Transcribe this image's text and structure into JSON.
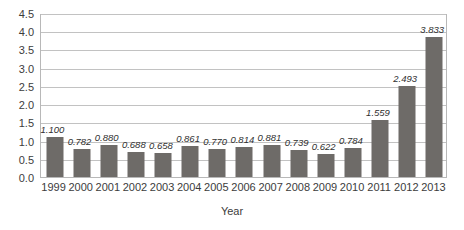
{
  "chart_data": {
    "type": "bar",
    "title": "",
    "xlabel": "Year",
    "ylabel": "",
    "categories": [
      "1999",
      "2000",
      "2001",
      "2002",
      "2003",
      "2004",
      "2005",
      "2006",
      "2007",
      "2008",
      "2009",
      "2010",
      "2011",
      "2012",
      "2013"
    ],
    "values": [
      1.1,
      0.782,
      0.88,
      0.688,
      0.658,
      0.861,
      0.77,
      0.814,
      0.881,
      0.739,
      0.622,
      0.784,
      1.559,
      2.493,
      3.833
    ],
    "data_labels": [
      "1.100",
      "0.782",
      "0.880",
      "0.688",
      "0.658",
      "0.861",
      "0.770",
      "0.814",
      "0.881",
      "0.739",
      "0.622",
      "0.784",
      "1.559",
      "2.493",
      "3.833"
    ],
    "ylim": [
      0.0,
      4.5
    ],
    "ytick_labels": [
      "0.0",
      "0.5",
      "1.0",
      "1.5",
      "2.0",
      "2.5",
      "3.0",
      "3.5",
      "4.0",
      "4.5"
    ],
    "ytick_values": [
      0.0,
      0.5,
      1.0,
      1.5,
      2.0,
      2.5,
      3.0,
      3.5,
      4.0,
      4.5
    ],
    "grid": true,
    "legend": "none",
    "bar_color": "#6e6b68",
    "gridline_color": "#c2c2c2",
    "plot_border_color": "#b8b8b8",
    "background_color": "#ffffff"
  }
}
